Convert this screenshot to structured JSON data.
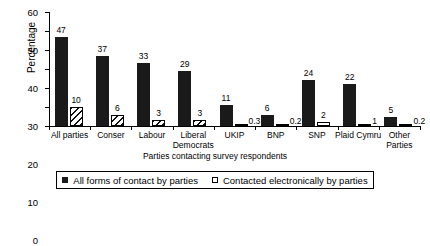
{
  "chart_data": {
    "type": "bar",
    "title": "",
    "subtitle": "",
    "xlabel": "Parties contacting survey respondents",
    "ylabel": "Percentage",
    "ylim": [
      0,
      60
    ],
    "yticks": [
      0,
      10,
      20,
      30,
      40,
      50,
      60
    ],
    "ytick_labels": [
      "0",
      "10",
      "20",
      "30",
      "40",
      "50",
      "60"
    ],
    "grid": false,
    "legend_position": "bottom",
    "categories": [
      "All parties",
      "Conser",
      "Labour",
      "Liberal\nDemocrats",
      "UKIP",
      "BNP",
      "SNP",
      "Plaid Cymru",
      "Other Parties"
    ],
    "series": [
      {
        "name": "All forms of contact by parties",
        "marker": "solid-black-square",
        "values": [
          47,
          37,
          33,
          29,
          11,
          6,
          24,
          22,
          5
        ],
        "value_labels": [
          "47",
          "37",
          "33",
          "29",
          "11",
          "6",
          "24",
          "22",
          "5"
        ]
      },
      {
        "name": "Contacted electronically by parties",
        "marker": "open-white-square",
        "values": [
          10,
          6,
          3,
          3,
          0.3,
          0.2,
          2,
          1,
          0.2
        ],
        "value_labels": [
          "10",
          "6",
          "3",
          "3",
          "0.3",
          "0.2",
          "2",
          "1",
          "0.2"
        ]
      }
    ]
  },
  "legend": {
    "items": [
      {
        "label": "All forms of contact by parties",
        "key": "solid"
      },
      {
        "label": "Contacted electronically by parties",
        "key": "open"
      }
    ]
  },
  "colors": {
    "series1": "#1a1a1a",
    "series2_fill": "#ffffff",
    "axis": "#000000",
    "background": "#ffffff"
  }
}
